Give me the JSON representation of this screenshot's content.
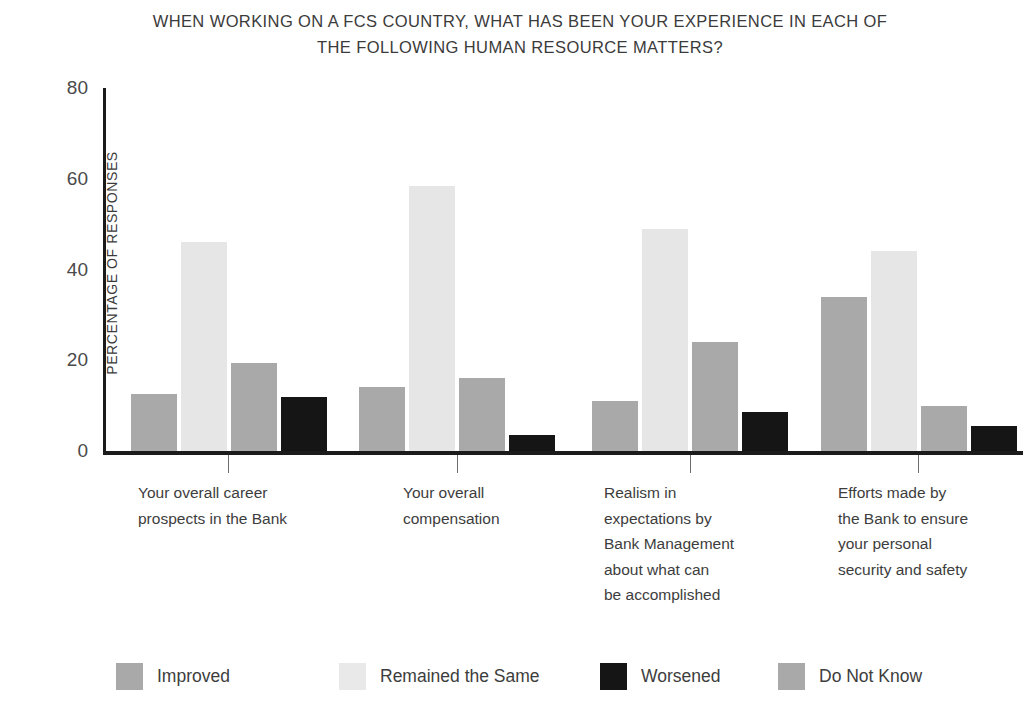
{
  "chart_data": {
    "type": "bar",
    "title": "WHEN WORKING ON A FCS COUNTRY, WHAT HAS BEEN YOUR EXPERIENCE IN EACH OF THE FOLLOWING HUMAN RESOURCE MATTERS?",
    "title_lines": [
      "WHEN WORKING ON A FCS COUNTRY, WHAT HAS BEEN YOUR EXPERIENCE IN EACH OF",
      "THE FOLLOWING HUMAN RESOURCE MATTERS?"
    ],
    "xlabel": "",
    "ylabel": "PERCENTAGE OF RESPONSES",
    "ylim": [
      0,
      80
    ],
    "yticks": [
      0,
      20,
      40,
      60,
      80
    ],
    "ytick_labels": [
      "0",
      "20",
      "40",
      "60",
      "80"
    ],
    "grid": false,
    "legend_position": "bottom",
    "categories": [
      "Your overall career prospects in the Bank",
      "Your overall compensation",
      "Realism in expectations by Bank Management about what can be accomplished",
      "Efforts made by the Bank to ensure your personal security and safety"
    ],
    "category_lines": [
      [
        "Your overall career",
        "prospects in the Bank"
      ],
      [
        "Your overall",
        "compensation"
      ],
      [
        "Realism in",
        "expectations by",
        "Bank Management",
        "about what can",
        "be accomplished"
      ],
      [
        "Efforts made by",
        "the Bank to ensure",
        "your personal",
        "security and safety"
      ]
    ],
    "series": [
      {
        "name": "Improved",
        "color": "#a9a9a9",
        "values": [
          12.5,
          14,
          11,
          34
        ]
      },
      {
        "name": "Remained the Same",
        "color": "#e6e6e6",
        "values": [
          46,
          58.5,
          49,
          44
        ]
      },
      {
        "name": "Do Not Know",
        "color": "#a9a9a9",
        "values": [
          19.5,
          16,
          24,
          10
        ]
      },
      {
        "name": "Worsened",
        "color": "#151515",
        "values": [
          12,
          3.5,
          8.5,
          5.5
        ]
      }
    ],
    "legend": [
      {
        "label": "Improved",
        "color": "#a9a9a9"
      },
      {
        "label": "Remained the Same",
        "color": "#e9e9e9"
      },
      {
        "label": "Worsened",
        "color": "#151515"
      },
      {
        "label": "Do Not Know",
        "color": "#a9a9a9"
      }
    ]
  }
}
